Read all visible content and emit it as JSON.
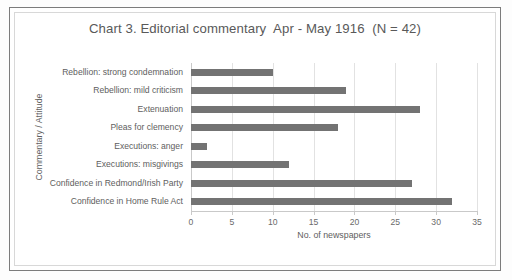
{
  "chart_data": {
    "type": "bar",
    "orientation": "horizontal",
    "title": "Chart 3. Editorial commentary  Apr - May 1916  (N = 42)",
    "xlabel": "No. of newspapers",
    "ylabel": "Commentary / Attitude",
    "categories": [
      "Rebellion: strong condemnation",
      "Rebellion: mild criticism",
      "Extenuation",
      "Pleas for clemency",
      "Executions: anger",
      "Executions: misgivings",
      "Confidence in Redmond/Irish Party",
      "Confidence in Home Rule Act"
    ],
    "values": [
      10,
      19,
      28,
      18,
      2,
      12,
      27,
      32
    ],
    "xlim": [
      0,
      35
    ],
    "xticks": [
      0,
      5,
      10,
      15,
      20,
      25,
      30,
      35
    ],
    "xtick_labels": [
      "0",
      "5",
      "10",
      "15",
      "20",
      "25",
      "30",
      "35"
    ],
    "grid": "vertical",
    "legend": "none",
    "bar_color": "#737373",
    "plot_background": "#ffffff",
    "gridline_color": "#e2e2e2",
    "text_color": "#5e5e5e"
  }
}
